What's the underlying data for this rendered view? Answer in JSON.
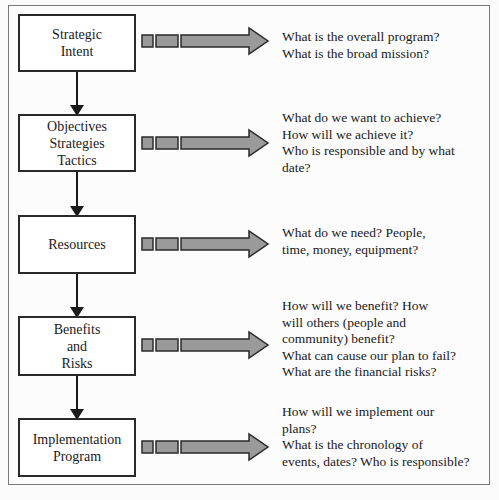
{
  "diagram": {
    "title": "",
    "stages": [
      {
        "label": "Strategic\nIntent",
        "description": "What is the overall program?\nWhat is the broad mission?"
      },
      {
        "label": "Objectives\nStrategies\nTactics",
        "description": "What do we want to achieve?\nHow will we achieve it?\nWho is responsible and by what\ndate?"
      },
      {
        "label": "Resources",
        "description": "What do we need?  People,\n time, money, equipment?"
      },
      {
        "label": "Benefits\nand\nRisks",
        "description": "How will we benefit?  How\nwill others (people and\ncommunity) benefit?\nWhat can cause our plan to fail?\nWhat are the financial risks?"
      },
      {
        "label": "Implementation\nProgram",
        "description": "How will we implement our\nplans?\nWhat is the chronology of\nevents, dates? Who is responsible?"
      }
    ],
    "colors": {
      "box_border": "#2a2a2a",
      "arrow_fill": "#9a9a9a",
      "arrow_stroke": "#2a2a2a",
      "frame_border": "#7a7a7a"
    }
  }
}
